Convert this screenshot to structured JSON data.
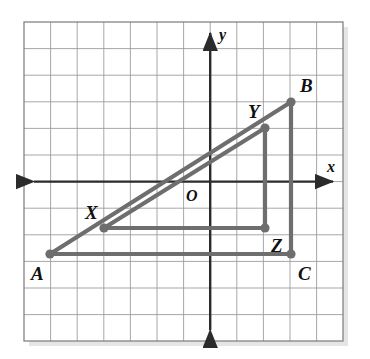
{
  "figure": {
    "kind": "coordinate-grid-geometry-diagram",
    "colors": {
      "grid_line": "#9a9a9a",
      "grid_border": "#6f6f6f",
      "axis": "#2b2b2b",
      "triangle_stroke": "#6e6e6e",
      "point_fill": "#6e6e6e",
      "label_text": "#111111",
      "background": "#ffffff"
    },
    "grid": {
      "columns": 12,
      "rows": 12,
      "cell_size_px": 26.6,
      "left_px": 24,
      "top_px": 22,
      "right_px": 343,
      "bottom_px": 341
    },
    "axes": {
      "origin_px": {
        "x": 211,
        "y": 181
      },
      "x_axis": {
        "label": "x",
        "label_px": {
          "x": 330,
          "y": 172
        },
        "arrow_both_ends": true
      },
      "y_axis": {
        "label": "y",
        "label_px": {
          "x": 222,
          "y": 37
        },
        "arrow_both_ends": true
      },
      "origin_label": "O",
      "origin_label_px": {
        "x": 186,
        "y": 200
      }
    },
    "points": [
      {
        "name": "A",
        "px": {
          "x": 50,
          "y": 254
        },
        "grid": {
          "x": -6,
          "y": -3
        },
        "label_px": {
          "x": 31,
          "y": 280
        },
        "dot": true
      },
      {
        "name": "B",
        "px": {
          "x": 291,
          "y": 102
        },
        "grid": {
          "x": 3,
          "y": 3
        },
        "label_px": {
          "x": 300,
          "y": 92
        },
        "dot": true
      },
      {
        "name": "C",
        "px": {
          "x": 291,
          "y": 254
        },
        "grid": {
          "x": 3,
          "y": -3
        },
        "label_px": {
          "x": 298,
          "y": 280
        },
        "dot": true
      },
      {
        "name": "X",
        "px": {
          "x": 104,
          "y": 228
        },
        "grid": {
          "x": -4,
          "y": -2
        },
        "label_px": {
          "x": 85,
          "y": 219
        },
        "dot": true
      },
      {
        "name": "Y",
        "px": {
          "x": 265,
          "y": 128
        },
        "grid": {
          "x": 2,
          "y": 2
        },
        "label_px": {
          "x": 248,
          "y": 118
        },
        "dot": true
      },
      {
        "name": "Z",
        "px": {
          "x": 265,
          "y": 228
        },
        "grid": {
          "x": 2,
          "y": -2
        },
        "label_px": {
          "x": 271,
          "y": 252
        },
        "dot": true
      }
    ],
    "shapes": [
      {
        "name": "triangle-ABC",
        "vertices": [
          "A",
          "B",
          "C"
        ]
      },
      {
        "name": "triangle-XYZ",
        "vertices": [
          "X",
          "Y",
          "Z"
        ]
      }
    ]
  }
}
